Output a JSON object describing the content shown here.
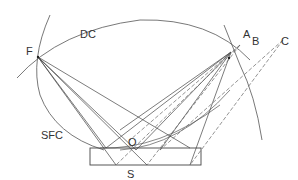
{
  "diagram": {
    "labels": {
      "F": "F",
      "DC": "DC",
      "A": "A",
      "B": "B",
      "C": "C",
      "SFC": "SFC",
      "O": "O",
      "S": "S"
    },
    "colors": {
      "line": "#444444",
      "dashed": "#666666",
      "text": "#333333",
      "background": "#ffffff"
    }
  }
}
